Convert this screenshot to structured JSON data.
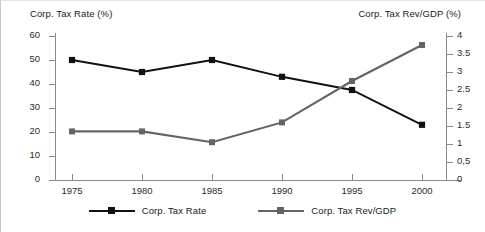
{
  "chart_data": {
    "type": "line",
    "title": "",
    "subtitle": "",
    "xlabel": "",
    "x": [
      1975,
      1980,
      1985,
      1990,
      1995,
      2000
    ],
    "x_tick_labels": [
      "1975",
      "1980",
      "1985",
      "1990",
      "1995",
      "2000"
    ],
    "grid": false,
    "legend_position": "bottom",
    "left_axis": {
      "label": "Corp. Tax Rate (%)",
      "ylim": [
        0,
        60
      ],
      "ticks": [
        60,
        50,
        40,
        30,
        20,
        10,
        0
      ],
      "tick_labels": [
        "60",
        "50",
        "40",
        "30",
        "20",
        "10",
        "0"
      ]
    },
    "right_axis": {
      "label": "Corp. Tax Rev/GDP (%)",
      "ylim": [
        0,
        4
      ],
      "ticks": [
        4,
        3.5,
        3,
        2.5,
        2,
        1.5,
        1,
        0.5,
        0
      ],
      "tick_labels": [
        "4",
        "3.5",
        "3",
        "2.5",
        "2",
        "1.5",
        "1",
        "0,5",
        "0"
      ]
    },
    "series": [
      {
        "name": "Corp. Tax Rate",
        "axis": "left",
        "color": "#111111",
        "marker": "square",
        "values": [
          50,
          45,
          50,
          43,
          37.5,
          23
        ]
      },
      {
        "name": "Corp. Tax Rev/GDP",
        "axis": "right",
        "color": "#646464",
        "marker": "square",
        "values": [
          1.35,
          1.35,
          1.05,
          1.6,
          2.75,
          3.75
        ]
      }
    ]
  },
  "legend": {
    "entries": [
      {
        "label": "Corp. Tax Rate",
        "color": "#111111"
      },
      {
        "label": "Corp. Tax Rev/GDP",
        "color": "#646464"
      }
    ]
  },
  "colors": {
    "tax_rate_line": "#111111",
    "tax_rev_line": "#646464",
    "axis": "#8a8a8a",
    "text": "#1a1a1a",
    "background": "#ffffff"
  }
}
